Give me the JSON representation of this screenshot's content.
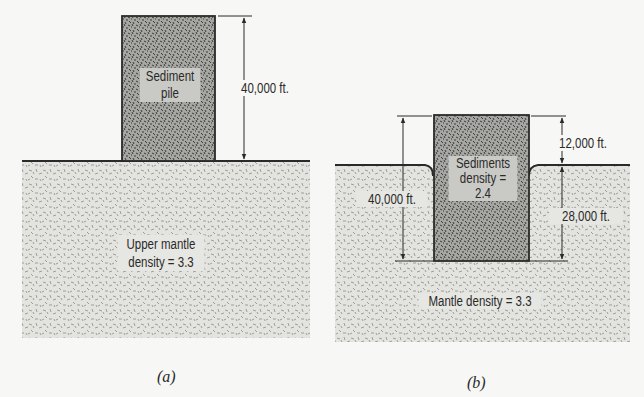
{
  "figure": {
    "panels": [
      {
        "id": "a",
        "caption": "(a)",
        "sediment_label_line1": "Sediment",
        "sediment_label_line2": "pile",
        "height_label": "40,000 ft.",
        "mantle_label_line1": "Upper mantle",
        "mantle_label_line2": "density = 3.3"
      },
      {
        "id": "b",
        "caption": "(b)",
        "sediment_label_line1": "Sediments",
        "sediment_label_line2": "density =",
        "sediment_label_line3": "2.4",
        "total_height_label": "40,000 ft.",
        "above_surface_label": "12,000 ft.",
        "below_surface_label": "28,000 ft.",
        "mantle_label": "Mantle density = 3.3"
      }
    ],
    "colors": {
      "background": "#f7f7f5",
      "mantle_fill": "#e3e3df",
      "sediment_fill": "#a8a8a4",
      "line": "#2a2a2a"
    }
  }
}
